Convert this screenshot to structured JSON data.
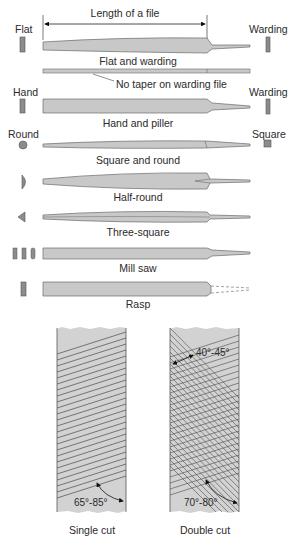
{
  "figure": {
    "dimension_label": "Length of a file",
    "taper_note": "No taper on warding file",
    "colors": {
      "file_fill": "#c8c8c8",
      "file_stroke": "#6a6a6a",
      "section_fill": "#8c8c8c",
      "panel_fill": "#d2d2d2",
      "cut_line": "#4a4a4a"
    },
    "files": [
      {
        "name": "Flat and warding",
        "left_section": "Flat",
        "right_section": "Warding"
      },
      {
        "name": "Hand and piller",
        "left_section": "Hand",
        "right_section": "Warding"
      },
      {
        "name": "Square and round",
        "left_section": "Round",
        "right_section": "Square"
      },
      {
        "name": "Half-round",
        "left_section": "",
        "right_section": ""
      },
      {
        "name": "Three-square",
        "left_section": "",
        "right_section": ""
      },
      {
        "name": "Mill saw",
        "left_section": "",
        "right_section": ""
      },
      {
        "name": "Rasp",
        "left_section": "",
        "right_section": ""
      }
    ],
    "cuts": [
      {
        "name": "Single cut",
        "angle_label": "65°-85°"
      },
      {
        "name": "Double cut",
        "angle_label": "70°-80°",
        "secondary_angle_label": "40°-45°"
      }
    ]
  }
}
